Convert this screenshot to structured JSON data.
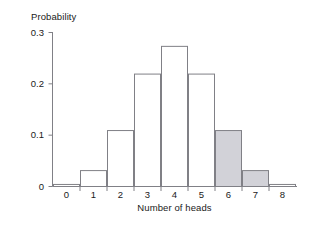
{
  "chart_data": {
    "type": "bar",
    "title": "",
    "xlabel": "Number of heads",
    "ylabel": "Probability",
    "categories": [
      "0",
      "1",
      "2",
      "3",
      "4",
      "5",
      "6",
      "7",
      "8"
    ],
    "values": [
      0.004,
      0.031,
      0.109,
      0.219,
      0.273,
      0.219,
      0.109,
      0.031,
      0.004
    ],
    "highlighted": [
      "6",
      "7"
    ],
    "highlight_color": "#d2d2d8",
    "bar_fill_color": "#ffffff",
    "bar_border_color": "#808086",
    "axis_color": "#808086",
    "ylim": [
      0,
      0.3
    ],
    "yticks": [
      "0",
      "0.1",
      "0.2",
      "0.3"
    ],
    "ytick_values": [
      0,
      0.1,
      0.2,
      0.3
    ],
    "xtick_labels": [
      "0",
      "1",
      "2",
      "3",
      "4",
      "5",
      "6",
      "7",
      "8"
    ],
    "grid": false,
    "legend": false
  }
}
